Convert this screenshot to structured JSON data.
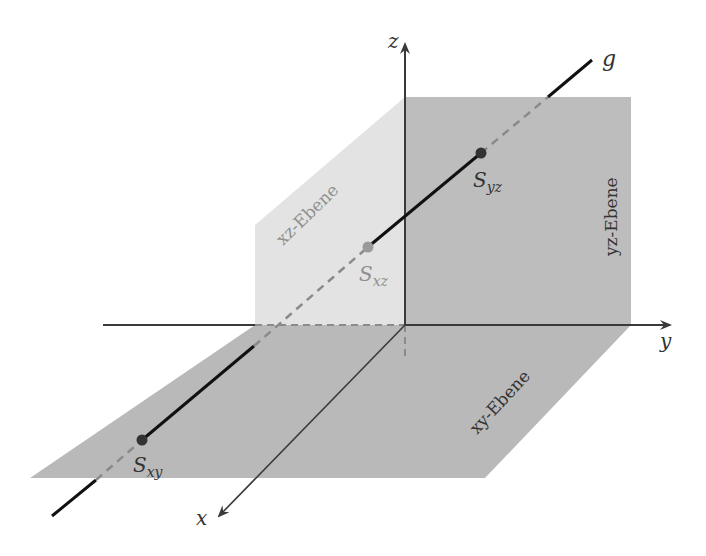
{
  "diagram": {
    "axes": {
      "x": "x",
      "y": "y",
      "z": "z"
    },
    "line": {
      "label": "g"
    },
    "planes": {
      "xy": {
        "label": "xy-Ebene",
        "color": "#b9b9b9"
      },
      "xz": {
        "label": "xz-Ebene",
        "color": "#e3e3e3"
      },
      "yz": {
        "label": "yz-Ebene",
        "color": "#bdbdbd"
      }
    },
    "points": {
      "Sxy": {
        "main": "S",
        "sub": "xy"
      },
      "Sxz": {
        "main": "S",
        "sub": "xz"
      },
      "Syz": {
        "main": "S",
        "sub": "yz"
      }
    },
    "colors": {
      "axis": "#3a3a3a",
      "line": "#111111",
      "dashed": "#8a8a8a",
      "point_dark": "#333333",
      "point_light": "#9a9a9a",
      "label": "#333333",
      "label_light": "#8f8f8f"
    }
  }
}
